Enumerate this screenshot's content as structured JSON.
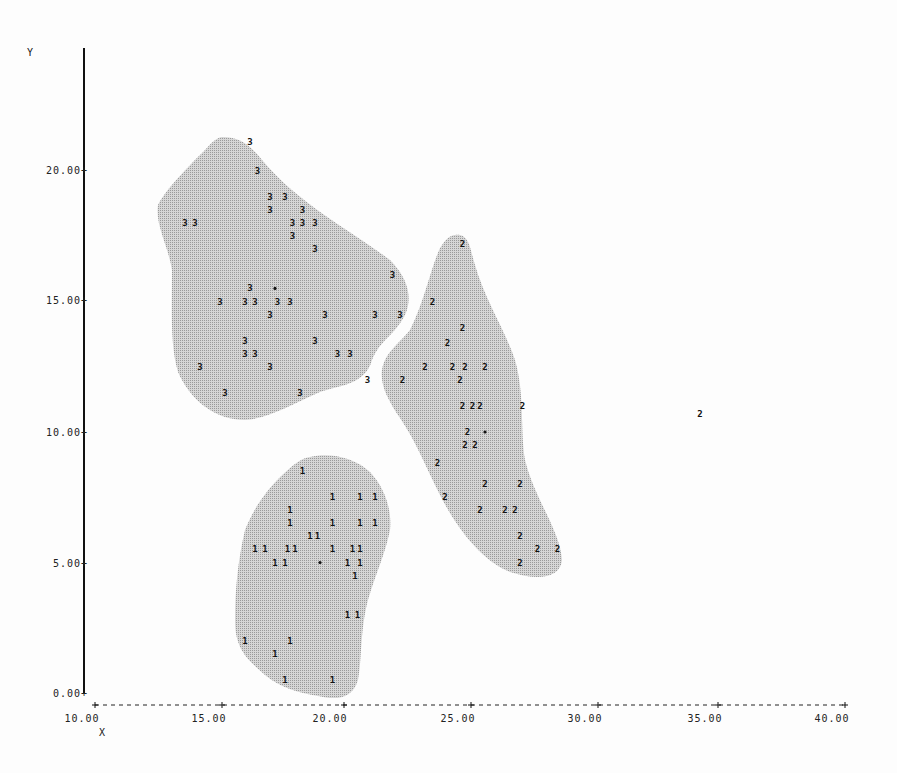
{
  "chart_data": {
    "type": "scatter",
    "title": "",
    "xlabel": "X",
    "ylabel": "Y",
    "xlim": [
      10,
      40
    ],
    "ylim": [
      0,
      23
    ],
    "x_ticks": [
      "10.00",
      "15.00",
      "20.00",
      "25.00",
      "30.00",
      "35.00",
      "40.00"
    ],
    "y_ticks": [
      "0.00",
      "5.00",
      "10.00",
      "15.00",
      "20.00"
    ],
    "grid": false,
    "legend": "none",
    "annotation": "Points plotted as cluster-number glyphs; shaded regions outline clusters 1, 2, 3; '*' marks cluster centroids",
    "series": [
      {
        "name": "3",
        "marker": "3",
        "centroid": [
          17.2,
          15.5
        ],
        "points": [
          [
            16.2,
            21.1
          ],
          [
            16.5,
            20.0
          ],
          [
            17.0,
            19.0
          ],
          [
            17.6,
            19.0
          ],
          [
            17.0,
            18.5
          ],
          [
            18.3,
            18.5
          ],
          [
            13.6,
            18.0
          ],
          [
            14.0,
            18.0
          ],
          [
            17.9,
            18.0
          ],
          [
            18.3,
            18.0
          ],
          [
            18.8,
            18.0
          ],
          [
            17.9,
            17.5
          ],
          [
            18.8,
            17.0
          ],
          [
            21.9,
            16.0
          ],
          [
            16.2,
            15.5
          ],
          [
            15.0,
            15.0
          ],
          [
            16.0,
            15.0
          ],
          [
            16.4,
            15.0
          ],
          [
            17.3,
            15.0
          ],
          [
            17.8,
            15.0
          ],
          [
            17.0,
            14.5
          ],
          [
            19.2,
            14.5
          ],
          [
            21.2,
            14.5
          ],
          [
            22.2,
            14.5
          ],
          [
            16.0,
            13.5
          ],
          [
            18.8,
            13.5
          ],
          [
            16.0,
            13.0
          ],
          [
            16.4,
            13.0
          ],
          [
            19.7,
            13.0
          ],
          [
            20.2,
            13.0
          ],
          [
            14.2,
            12.5
          ],
          [
            17.0,
            12.5
          ],
          [
            20.9,
            12.0
          ],
          [
            15.2,
            11.5
          ],
          [
            18.2,
            11.5
          ]
        ]
      },
      {
        "name": "2",
        "marker": "2",
        "centroid": [
          25.6,
          10.0
        ],
        "points": [
          [
            24.7,
            17.2
          ],
          [
            23.5,
            15.0
          ],
          [
            24.7,
            14.0
          ],
          [
            24.1,
            13.4
          ],
          [
            23.2,
            12.5
          ],
          [
            24.3,
            12.5
          ],
          [
            24.8,
            12.5
          ],
          [
            25.6,
            12.5
          ],
          [
            24.6,
            12.0
          ],
          [
            22.3,
            12.0
          ],
          [
            24.7,
            11.0
          ],
          [
            25.1,
            11.0
          ],
          [
            25.4,
            11.0
          ],
          [
            27.1,
            11.0
          ],
          [
            24.9,
            10.0
          ],
          [
            24.8,
            9.5
          ],
          [
            25.2,
            9.5
          ],
          [
            23.7,
            8.8
          ],
          [
            25.6,
            8.0
          ],
          [
            27.0,
            8.0
          ],
          [
            24.0,
            7.5
          ],
          [
            25.4,
            7.0
          ],
          [
            26.4,
            7.0
          ],
          [
            26.8,
            7.0
          ],
          [
            27.0,
            6.0
          ],
          [
            27.7,
            5.5
          ],
          [
            28.5,
            5.5
          ],
          [
            27.0,
            5.0
          ],
          [
            34.2,
            10.7
          ]
        ]
      },
      {
        "name": "1",
        "marker": "1",
        "centroid": [
          19.0,
          5.0
        ],
        "points": [
          [
            18.3,
            8.5
          ],
          [
            19.5,
            7.5
          ],
          [
            20.6,
            7.5
          ],
          [
            21.2,
            7.5
          ],
          [
            17.8,
            7.0
          ],
          [
            17.8,
            6.5
          ],
          [
            19.5,
            6.5
          ],
          [
            20.6,
            6.5
          ],
          [
            21.2,
            6.5
          ],
          [
            18.6,
            6.0
          ],
          [
            18.9,
            6.0
          ],
          [
            16.4,
            5.5
          ],
          [
            16.8,
            5.5
          ],
          [
            17.7,
            5.5
          ],
          [
            18.0,
            5.5
          ],
          [
            19.5,
            5.5
          ],
          [
            20.3,
            5.5
          ],
          [
            20.6,
            5.5
          ],
          [
            17.2,
            5.0
          ],
          [
            17.6,
            5.0
          ],
          [
            20.1,
            5.0
          ],
          [
            20.6,
            5.0
          ],
          [
            20.4,
            4.5
          ],
          [
            20.1,
            3.0
          ],
          [
            20.5,
            3.0
          ],
          [
            16.0,
            2.0
          ],
          [
            17.8,
            2.0
          ],
          [
            17.2,
            1.5
          ],
          [
            17.6,
            0.5
          ],
          [
            19.5,
            0.5
          ]
        ]
      }
    ],
    "regions": [
      {
        "cluster": "3",
        "color": "#bdbdbd"
      },
      {
        "cluster": "2",
        "color": "#bdbdbd"
      },
      {
        "cluster": "1",
        "color": "#bdbdbd"
      }
    ]
  },
  "axes": {
    "x_title": "X",
    "y_title": "Y",
    "x_ticks": [
      "10.00",
      "15.00",
      "20.00",
      "25.00",
      "30.00",
      "35.00",
      "40.00"
    ],
    "y_ticks": [
      "0.00+",
      "5.00+",
      "10.00+",
      "15.00+",
      "20.00+"
    ]
  },
  "colors": {
    "background": "#fdfdfd",
    "region_fill": "#bdbdbd",
    "ink": "#111111"
  }
}
